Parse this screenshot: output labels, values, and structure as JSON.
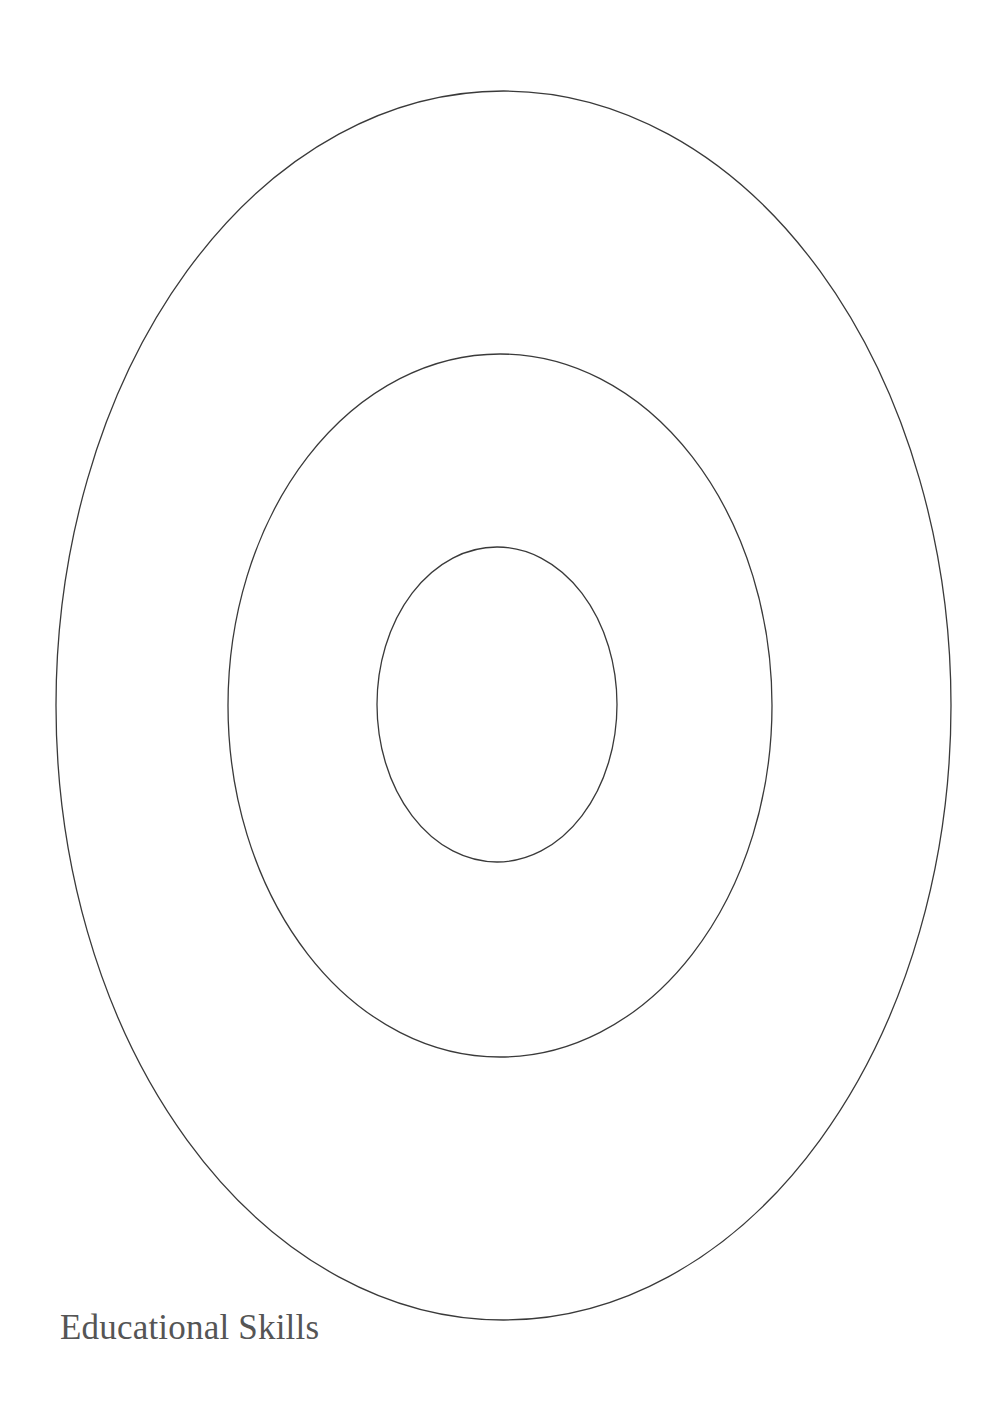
{
  "caption": "Educational Skills",
  "colors": {
    "background": "#ffffff",
    "stroke": "#3a3a3a",
    "caption": "#555555"
  },
  "rings": [
    {
      "name": "outer-ring",
      "cx": 503.5,
      "cy": 705.5,
      "rx": 447.5,
      "ry": 614.5
    },
    {
      "name": "middle-ring",
      "cx": 500,
      "cy": 705.5,
      "rx": 272,
      "ry": 351.5
    },
    {
      "name": "inner-ring",
      "cx": 497,
      "cy": 704.5,
      "rx": 120,
      "ry": 157.5
    }
  ]
}
